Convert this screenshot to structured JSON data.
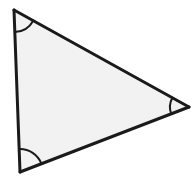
{
  "figure": {
    "kind": "geometry-figure",
    "shape_name": "triangle",
    "shape_type": "scalene triangle",
    "caption": "",
    "background_color": "#ffffff",
    "fill_color": "#f2f2f2",
    "stroke_color": "#1a1a1a",
    "stroke_width": 3,
    "arc_stroke_width": 2,
    "canvas": {
      "width": 196,
      "height": 180
    },
    "vertices": [
      {
        "id": "top-left",
        "label": "",
        "x": 14,
        "y": 10
      },
      {
        "id": "right",
        "label": "",
        "x": 189,
        "y": 107
      },
      {
        "id": "bottom-left",
        "label": "",
        "x": 20,
        "y": 172
      }
    ],
    "edges": [
      {
        "id": "top-edge",
        "from": "top-left",
        "to": "right",
        "label": ""
      },
      {
        "id": "right-edge",
        "from": "right",
        "to": "bottom-left",
        "label": ""
      },
      {
        "id": "left-edge",
        "from": "bottom-left",
        "to": "top-left",
        "label": ""
      }
    ],
    "angle_marks": [
      {
        "id": "angle-top-left",
        "at_vertex": "top-left",
        "label": "",
        "radius": 22,
        "path": "M 14.81 32.0 A 22 22 0 0 1 34.32 21.06"
      },
      {
        "id": "angle-right",
        "at_vertex": "right",
        "label": "",
        "radius": 19,
        "path": "M 170.42 91.01 A 19 19 0 0 0 170.95 123.05"
      },
      {
        "id": "angle-bottom-left",
        "at_vertex": "bottom-left",
        "label": "",
        "radius": 23,
        "path": "M 42.92 169.51 A 23 23 0 0 0 19.15 149.02"
      }
    ]
  }
}
